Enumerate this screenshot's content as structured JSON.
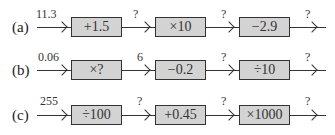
{
  "diagram": {
    "rows": [
      {
        "label": "(a)",
        "input": "11.3",
        "operations": [
          "+1.5",
          "×10",
          "−2.9"
        ],
        "outputs": [
          "?",
          "?",
          "?"
        ]
      },
      {
        "label": "(b)",
        "input": "0.06",
        "operations": [
          "×?",
          "−0.2",
          "÷10"
        ],
        "outputs": [
          "6",
          "?",
          "?"
        ]
      },
      {
        "label": "(c)",
        "input": "255",
        "operations": [
          "÷100",
          "+0.45",
          "×1000"
        ],
        "outputs": [
          "?",
          "?",
          "?"
        ]
      }
    ],
    "colors": {
      "box_fill": "#d3d3d3",
      "stroke": "#333333"
    }
  }
}
